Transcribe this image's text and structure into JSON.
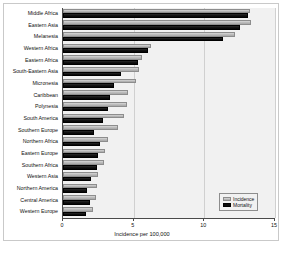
{
  "chart_data": {
    "type": "bar",
    "orientation": "horizontal",
    "title": "",
    "xlabel": "Incidence per 100,000",
    "ylabel": "",
    "xlim": [
      0,
      15
    ],
    "xticks": [
      0,
      5,
      10,
      15
    ],
    "grid": true,
    "legend_position": "bottom-right",
    "categories": [
      "Middle Africa",
      "Eastern Asia",
      "Melanesia",
      "Western Africa",
      "Eastern Africa",
      "South-Eastern Asia",
      "Micronesia",
      "Caribbean",
      "Polynesia",
      "South America",
      "Southern Europe",
      "Northern Africa",
      "Eastern Europe",
      "Southern Africa",
      "Western Asia",
      "Northern America",
      "Central America",
      "Western Europe"
    ],
    "series": [
      {
        "name": "Incidence",
        "color": "#bdbdbd",
        "values": [
          13.2,
          13.3,
          12.2,
          6.2,
          5.6,
          5.4,
          5.2,
          4.6,
          4.5,
          4.3,
          3.9,
          3.2,
          3.0,
          2.9,
          2.5,
          2.4,
          2.3,
          2.1
        ]
      },
      {
        "name": "Mortality",
        "color": "#0a0a0a",
        "values": [
          13.1,
          12.5,
          11.3,
          6.0,
          5.3,
          4.1,
          3.6,
          3.3,
          3.2,
          2.8,
          2.2,
          2.6,
          2.5,
          2.4,
          2.0,
          1.7,
          1.9,
          1.6
        ]
      }
    ]
  },
  "legend": {
    "items": [
      {
        "label": "Incidence"
      },
      {
        "label": "Mortality"
      }
    ]
  },
  "axis": {
    "x_tick_labels": [
      "0",
      "5",
      "10",
      "15"
    ],
    "x_title": "Incidence per 100,000"
  }
}
